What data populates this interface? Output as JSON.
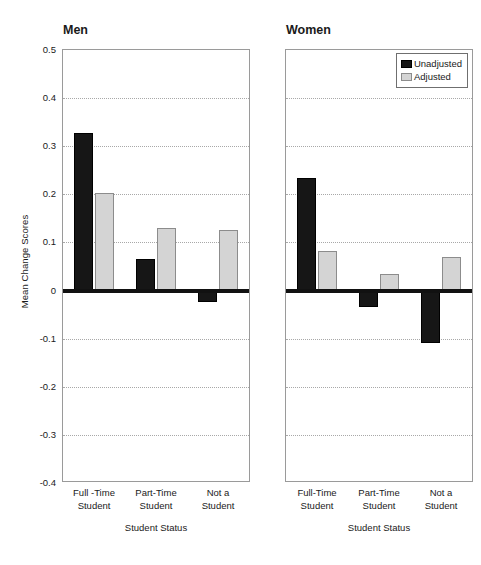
{
  "chart_data": {
    "type": "bar",
    "title": "",
    "ylabel": "Mean Change Scores",
    "xlabel": "Student Status",
    "ylim": [
      -0.4,
      0.5
    ],
    "ytick_labels": [
      "0.5",
      "0.4",
      "0.3",
      "0.2",
      "0.1",
      "0",
      "-0.1",
      "-0.2",
      "-0.3",
      "-0.4"
    ],
    "ytick_values": [
      0.5,
      0.4,
      0.3,
      0.2,
      0.1,
      0,
      -0.1,
      -0.2,
      -0.3,
      -0.4
    ],
    "grid": true,
    "grid_axis": "y",
    "legend": {
      "position": "top-right-of-second-panel",
      "entries": [
        {
          "name": "Unadjusted",
          "color": "#161616"
        },
        {
          "name": "Adjusted",
          "color": "#d4d4d4"
        }
      ]
    },
    "panels": [
      {
        "title": "Men",
        "categories": [
          "Full -Time\nStudent",
          "Part-Time\nStudent",
          "Not a\nStudent"
        ],
        "category_lines": [
          [
            "Full -Time",
            "Student"
          ],
          [
            "Part-Time",
            "Student"
          ],
          [
            "Not a",
            "Student"
          ]
        ],
        "series": [
          {
            "name": "Unadjusted",
            "values": [
              0.328,
              0.065,
              -0.023
            ]
          },
          {
            "name": "Adjusted",
            "values": [
              0.203,
              0.131,
              0.125
            ]
          }
        ]
      },
      {
        "title": "Women",
        "categories": [
          "Full-Time\nStudent",
          "Part-Time\nStudent",
          "Not a\nStudent"
        ],
        "category_lines": [
          [
            "Full-Time",
            "Student"
          ],
          [
            "Part-Time",
            "Student"
          ],
          [
            "Not a",
            "Student"
          ]
        ],
        "series": [
          {
            "name": "Unadjusted",
            "values": [
              0.233,
              -0.035,
              -0.11
            ]
          },
          {
            "name": "Adjusted",
            "values": [
              0.082,
              0.035,
              0.069
            ]
          }
        ]
      }
    ]
  },
  "colors": {
    "unadjusted": "#161616",
    "adjusted": "#d4d4d4",
    "axis": "#9a9a9a",
    "grid": "#a8a8a8",
    "zero_line": "#111111"
  }
}
